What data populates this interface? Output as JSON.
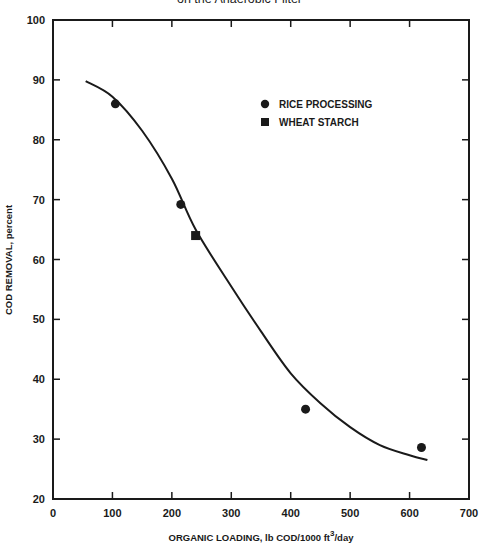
{
  "chart_data": {
    "type": "scatter",
    "title": "on the Anaerobic Filter",
    "xlabel": "ORGANIC LOADING, lb COD/1000 ft³/day",
    "xlabel_main": "ORGANIC LOADING, lb COD/1000 ft",
    "xlabel_sup": "3",
    "xlabel_tail": "/day",
    "ylabel": "COD REMOVAL, percent",
    "xlim": [
      0,
      700
    ],
    "ylim": [
      20,
      100
    ],
    "xticks": [
      0,
      100,
      200,
      300,
      400,
      500,
      600,
      700
    ],
    "yticks": [
      20,
      30,
      40,
      50,
      60,
      70,
      80,
      90,
      100
    ],
    "grid": false,
    "legend_position": "upper right (inside)",
    "series": [
      {
        "name": "RICE PROCESSING",
        "marker": "circle",
        "points": [
          [
            105,
            86
          ],
          [
            215,
            69.2
          ],
          [
            425,
            35
          ],
          [
            620,
            28.6
          ]
        ]
      },
      {
        "name": "WHEAT STARCH",
        "marker": "square",
        "points": [
          [
            240,
            64
          ]
        ]
      },
      {
        "name": "fitted curve",
        "marker": "line",
        "points": [
          [
            55,
            89.8
          ],
          [
            100,
            87.2
          ],
          [
            150,
            81.5
          ],
          [
            200,
            73.5
          ],
          [
            240,
            65
          ],
          [
            300,
            55.5
          ],
          [
            350,
            48
          ],
          [
            400,
            41
          ],
          [
            450,
            36
          ],
          [
            500,
            32
          ],
          [
            550,
            29
          ],
          [
            600,
            27.3
          ],
          [
            630,
            26.5
          ]
        ]
      }
    ]
  },
  "legend": {
    "items": [
      {
        "label": "RICE PROCESSING",
        "marker": "circle"
      },
      {
        "label": "WHEAT STARCH",
        "marker": "square"
      }
    ]
  },
  "colors": {
    "ink": "#1a1a1a",
    "background": "#ffffff"
  }
}
